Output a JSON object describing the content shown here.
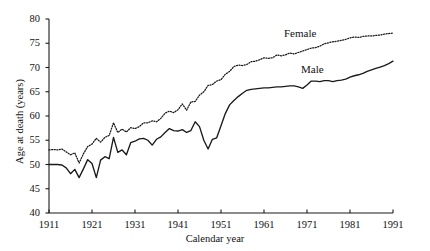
{
  "chart_data": {
    "type": "line",
    "title": "",
    "xlabel": "Calendar year",
    "ylabel": "Age at death (years)",
    "xlim": [
      1911,
      1991
    ],
    "ylim": [
      40,
      80
    ],
    "xticks": [
      1911,
      1921,
      1931,
      1941,
      1951,
      1961,
      1971,
      1981,
      1991
    ],
    "yticks": [
      40,
      45,
      50,
      55,
      60,
      65,
      70,
      75,
      80
    ],
    "grid": false,
    "legend_position": "inline-annotation",
    "annotations": [
      {
        "text": "Female",
        "x": 1971,
        "y": 76.5
      },
      {
        "text": "Male",
        "x": 1975,
        "y": 69.0
      }
    ],
    "x": [
      1911,
      1912,
      1913,
      1914,
      1915,
      1916,
      1917,
      1918,
      1919,
      1920,
      1921,
      1922,
      1923,
      1924,
      1925,
      1926,
      1927,
      1928,
      1929,
      1930,
      1931,
      1932,
      1933,
      1934,
      1935,
      1936,
      1937,
      1938,
      1939,
      1940,
      1941,
      1942,
      1943,
      1944,
      1945,
      1946,
      1947,
      1948,
      1949,
      1950,
      1951,
      1952,
      1953,
      1954,
      1955,
      1956,
      1957,
      1958,
      1959,
      1960,
      1961,
      1962,
      1963,
      1964,
      1965,
      1966,
      1967,
      1968,
      1969,
      1970,
      1971,
      1972,
      1973,
      1974,
      1975,
      1976,
      1977,
      1978,
      1979,
      1980,
      1981,
      1982,
      1983,
      1984,
      1985,
      1986,
      1987,
      1988,
      1989,
      1990,
      1991
    ],
    "series": [
      {
        "name": "Female",
        "style": "dotted",
        "color": "#1a1a1a",
        "values": [
          53.0,
          53.1,
          53.0,
          53.2,
          52.6,
          52.0,
          52.4,
          50.3,
          52.2,
          53.7,
          54.2,
          55.4,
          54.6,
          55.6,
          56.0,
          58.6,
          56.6,
          57.3,
          56.7,
          57.6,
          57.4,
          57.8,
          58.6,
          58.6,
          59.0,
          58.8,
          59.5,
          60.6,
          61.0,
          60.7,
          61.3,
          62.5,
          61.2,
          62.9,
          63.0,
          64.3,
          65.0,
          66.3,
          66.5,
          67.2,
          67.5,
          68.6,
          69.2,
          70.2,
          70.5,
          70.4,
          70.6,
          71.2,
          71.3,
          71.6,
          72.0,
          71.9,
          72.0,
          72.6,
          72.4,
          72.6,
          73.0,
          72.8,
          73.1,
          73.4,
          73.7,
          74.0,
          74.1,
          74.4,
          74.9,
          75.1,
          75.3,
          75.4,
          75.6,
          75.8,
          76.1,
          76.3,
          76.2,
          76.4,
          76.5,
          76.5,
          76.6,
          76.7,
          76.9,
          77.0,
          77.1
        ]
      },
      {
        "name": "Male",
        "style": "solid",
        "color": "#1a1a1a",
        "values": [
          50.0,
          50.0,
          50.0,
          49.9,
          49.3,
          48.1,
          49.0,
          47.3,
          49.1,
          51.0,
          50.2,
          47.3,
          50.9,
          51.6,
          51.2,
          55.6,
          52.5,
          53.0,
          52.0,
          54.5,
          54.8,
          55.3,
          55.4,
          55.0,
          54.0,
          55.2,
          55.7,
          56.6,
          57.4,
          57.0,
          56.9,
          57.2,
          56.6,
          57.0,
          58.8,
          57.8,
          55.0,
          53.2,
          55.2,
          55.5,
          58.0,
          60.5,
          62.3,
          63.2,
          64.0,
          64.7,
          65.3,
          65.5,
          65.6,
          65.7,
          65.8,
          65.8,
          65.9,
          66.0,
          66.0,
          66.1,
          66.2,
          66.2,
          66.0,
          65.7,
          66.4,
          67.2,
          67.2,
          67.1,
          67.3,
          67.3,
          67.1,
          67.3,
          67.4,
          67.6,
          68.0,
          68.3,
          68.5,
          68.8,
          69.2,
          69.5,
          69.8,
          70.1,
          70.4,
          70.8,
          71.3
        ]
      }
    ]
  }
}
